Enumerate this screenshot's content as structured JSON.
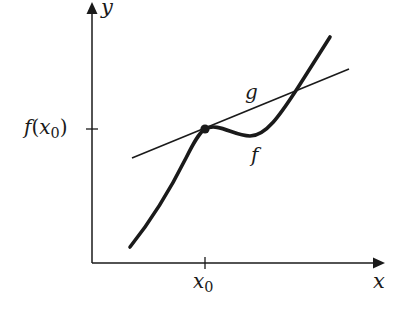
{
  "diagram": {
    "colors": {
      "stroke": "#1a1a1a",
      "background": "#ffffff"
    },
    "axes": {
      "x_label": "x",
      "y_label": "y"
    },
    "ticks": {
      "x_tick_label_base": "x",
      "x_tick_label_sub": "0",
      "y_tick_label_fn": "f",
      "y_tick_label_open": "(",
      "y_tick_label_var": "x",
      "y_tick_label_sub": "0",
      "y_tick_label_close": ")"
    },
    "curves": {
      "f_label": "f",
      "g_label": "g"
    },
    "points": {
      "tangent_point": "(x0, f(x0))"
    }
  }
}
